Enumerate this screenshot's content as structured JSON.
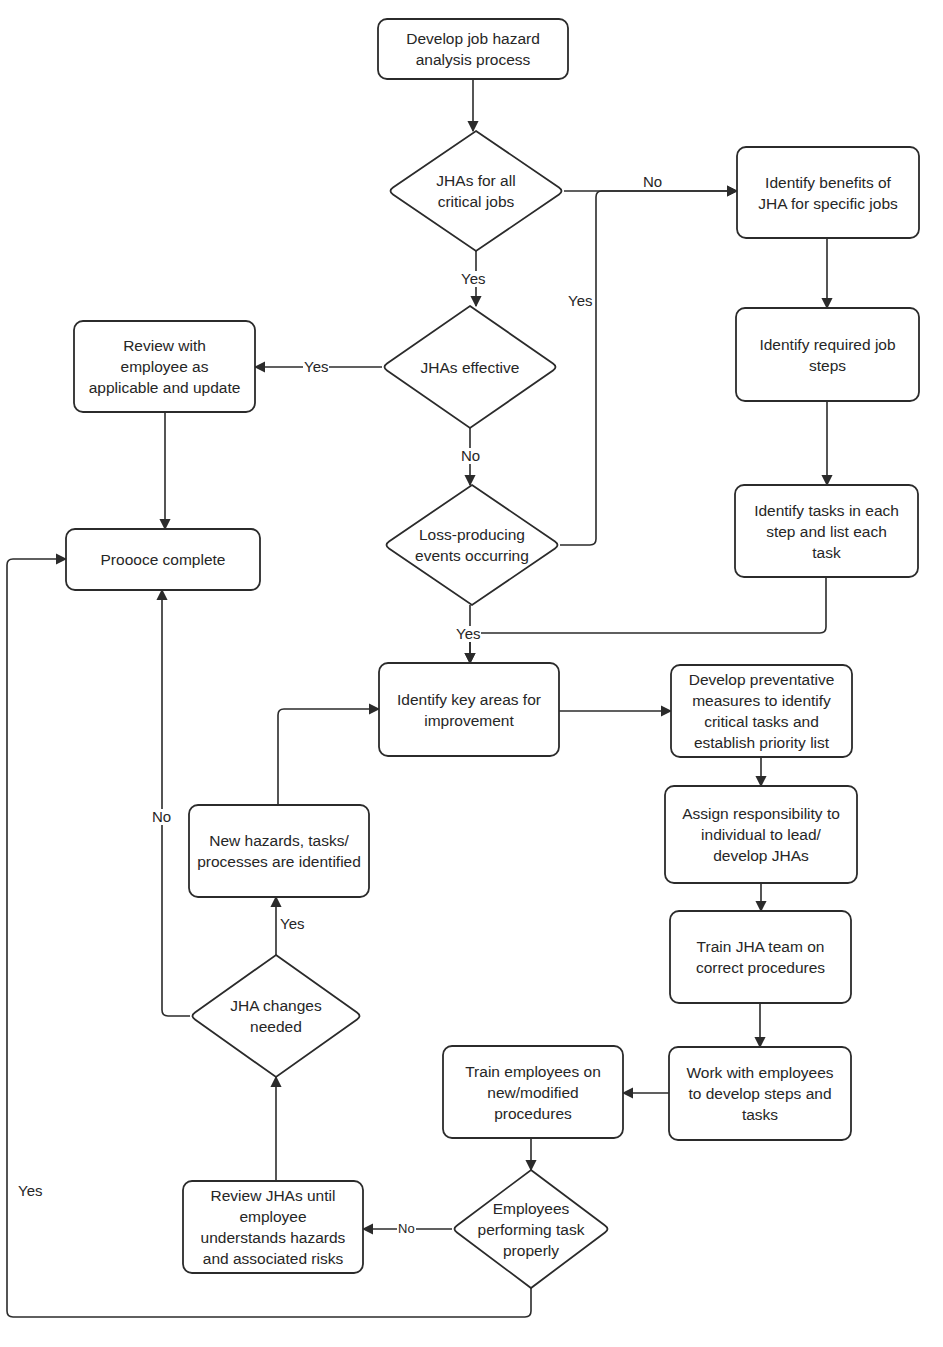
{
  "diagram": {
    "type": "flowchart",
    "colors": {
      "background": "#ffffff",
      "stroke": "#2b2b2b",
      "text": "#262626"
    },
    "nodes": [
      {
        "id": "start",
        "shape": "rounded-rect",
        "text": "Develop job hazard\nanalysis process",
        "x": 378,
        "y": 19,
        "w": 190,
        "h": 60
      },
      {
        "id": "d_critical",
        "shape": "diamond",
        "text": "JHAs for all\ncritical jobs",
        "x": 388,
        "y": 131,
        "w": 176,
        "h": 120
      },
      {
        "id": "benefits",
        "shape": "rounded-rect",
        "text": "Identify benefits of\nJHA for specific jobs",
        "x": 737,
        "y": 147,
        "w": 182,
        "h": 91
      },
      {
        "id": "d_effective",
        "shape": "diamond",
        "text": "JHAs effective",
        "x": 382,
        "y": 306,
        "w": 176,
        "h": 122
      },
      {
        "id": "review_update",
        "shape": "rounded-rect",
        "text": "Review with\nemployee as\napplicable and update",
        "x": 74,
        "y": 321,
        "w": 181,
        "h": 91
      },
      {
        "id": "job_steps",
        "shape": "rounded-rect",
        "text": "Identify required job\nsteps",
        "x": 736,
        "y": 308,
        "w": 183,
        "h": 93
      },
      {
        "id": "d_loss",
        "shape": "diamond",
        "text": "Loss-producing\nevents occurring",
        "x": 384,
        "y": 485,
        "w": 176,
        "h": 120
      },
      {
        "id": "tasks",
        "shape": "rounded-rect",
        "text": "Identify tasks in each\nstep and list each\ntask",
        "x": 735,
        "y": 485,
        "w": 183,
        "h": 92
      },
      {
        "id": "complete",
        "shape": "rounded-rect",
        "text": "Proooce complete",
        "x": 66,
        "y": 529,
        "w": 194,
        "h": 61
      },
      {
        "id": "key_areas",
        "shape": "rounded-rect",
        "text": "Identify key areas for\nimprovement",
        "x": 379,
        "y": 663,
        "w": 180,
        "h": 93
      },
      {
        "id": "preventative",
        "shape": "rounded-rect",
        "text": "Develop preventative\nmeasures to identify\ncritical tasks and\nestablish priority list",
        "x": 671,
        "y": 665,
        "w": 181,
        "h": 92
      },
      {
        "id": "assign",
        "shape": "rounded-rect",
        "text": "Assign responsibility to\nindividual to lead/\ndevelop JHAs",
        "x": 665,
        "y": 786,
        "w": 192,
        "h": 97
      },
      {
        "id": "new_hazards",
        "shape": "rounded-rect",
        "text": "New hazards, tasks/\nprocesses are identified",
        "x": 189,
        "y": 805,
        "w": 180,
        "h": 92
      },
      {
        "id": "train_team",
        "shape": "rounded-rect",
        "text": "Train JHA team on\ncorrect procedures",
        "x": 670,
        "y": 911,
        "w": 181,
        "h": 92
      },
      {
        "id": "d_changes",
        "shape": "diamond",
        "text": "JHA changes\nneeded",
        "x": 190,
        "y": 955,
        "w": 172,
        "h": 122
      },
      {
        "id": "train_employees",
        "shape": "rounded-rect",
        "text": "Train employees on\nnew/modified\nprocedures",
        "x": 443,
        "y": 1046,
        "w": 180,
        "h": 92
      },
      {
        "id": "work_with",
        "shape": "rounded-rect",
        "text": "Work with employees\nto develop steps and\ntasks",
        "x": 669,
        "y": 1047,
        "w": 182,
        "h": 93
      },
      {
        "id": "review_jhas",
        "shape": "rounded-rect",
        "text": "Review JHAs until\nemployee\nunderstands hazards\nand associated risks",
        "x": 183,
        "y": 1181,
        "w": 180,
        "h": 92
      },
      {
        "id": "d_performing",
        "shape": "diamond",
        "text": "Employees\nperforming task\nproperly",
        "x": 452,
        "y": 1170,
        "w": 158,
        "h": 118
      }
    ],
    "edges": [
      {
        "from": "start",
        "to": "d_critical",
        "label": "",
        "points": [
          [
            473,
            79
          ],
          [
            473,
            131
          ]
        ]
      },
      {
        "from": "d_critical",
        "to": "benefits",
        "label": "No",
        "points": [
          [
            564,
            191
          ],
          [
            737,
            191
          ]
        ]
      },
      {
        "from": "d_critical",
        "to": "d_effective",
        "label": "Yes",
        "points": [
          [
            476,
            251
          ],
          [
            476,
            306
          ]
        ]
      },
      {
        "from": "d_loss",
        "to": "benefits",
        "label": "Yes",
        "points": [
          [
            560,
            545
          ],
          [
            596,
            545
          ],
          [
            596,
            191
          ],
          [
            737,
            191
          ]
        ]
      },
      {
        "from": "benefits",
        "to": "job_steps",
        "label": "",
        "points": [
          [
            827,
            238
          ],
          [
            827,
            308
          ]
        ]
      },
      {
        "from": "job_steps",
        "to": "tasks",
        "label": "",
        "points": [
          [
            827,
            401
          ],
          [
            827,
            485
          ]
        ]
      },
      {
        "from": "d_effective",
        "to": "review_update",
        "label": "Yes",
        "points": [
          [
            382,
            367
          ],
          [
            255,
            367
          ]
        ]
      },
      {
        "from": "d_effective",
        "to": "d_loss",
        "label": "No",
        "points": [
          [
            470,
            428
          ],
          [
            470,
            485
          ]
        ]
      },
      {
        "from": "review_update",
        "to": "complete",
        "label": "",
        "points": [
          [
            165,
            412
          ],
          [
            165,
            529
          ]
        ]
      },
      {
        "from": "tasks",
        "to": "key_areas",
        "label": "",
        "points": [
          [
            826,
            577
          ],
          [
            826,
            633
          ],
          [
            470,
            633
          ],
          [
            470,
            663
          ]
        ]
      },
      {
        "from": "d_loss",
        "to": "key_areas",
        "label": "Yes",
        "points": [
          [
            470,
            605
          ],
          [
            470,
            663
          ]
        ]
      },
      {
        "from": "key_areas",
        "to": "preventative",
        "label": "",
        "points": [
          [
            559,
            711
          ],
          [
            671,
            711
          ]
        ]
      },
      {
        "from": "preventative",
        "to": "assign",
        "label": "",
        "points": [
          [
            761,
            757
          ],
          [
            761,
            786
          ]
        ]
      },
      {
        "from": "assign",
        "to": "train_team",
        "label": "",
        "points": [
          [
            761,
            883
          ],
          [
            761,
            911
          ]
        ]
      },
      {
        "from": "train_team",
        "to": "work_with",
        "label": "",
        "points": [
          [
            760,
            1003
          ],
          [
            760,
            1047
          ]
        ]
      },
      {
        "from": "work_with",
        "to": "train_employees",
        "label": "",
        "points": [
          [
            669,
            1093
          ],
          [
            623,
            1093
          ]
        ]
      },
      {
        "from": "train_employees",
        "to": "d_performing",
        "label": "",
        "points": [
          [
            531,
            1138
          ],
          [
            531,
            1170
          ]
        ]
      },
      {
        "from": "d_performing",
        "to": "review_jhas",
        "label": "No",
        "points": [
          [
            452,
            1229
          ],
          [
            363,
            1229
          ]
        ]
      },
      {
        "from": "d_performing",
        "to": "complete",
        "label": "Yes",
        "points": [
          [
            531,
            1288
          ],
          [
            531,
            1317
          ],
          [
            7,
            1317
          ],
          [
            7,
            559
          ],
          [
            66,
            559
          ]
        ]
      },
      {
        "from": "review_jhas",
        "to": "d_changes",
        "label": "",
        "points": [
          [
            276,
            1181
          ],
          [
            276,
            1077
          ]
        ]
      },
      {
        "from": "d_changes",
        "to": "new_hazards",
        "label": "Yes",
        "points": [
          [
            276,
            955
          ],
          [
            276,
            897
          ]
        ]
      },
      {
        "from": "d_changes",
        "to": "complete",
        "label": "No",
        "points": [
          [
            190,
            1016
          ],
          [
            162,
            1016
          ],
          [
            162,
            590
          ]
        ]
      },
      {
        "from": "new_hazards",
        "to": "key_areas",
        "label": "",
        "points": [
          [
            278,
            805
          ],
          [
            278,
            709
          ],
          [
            379,
            709
          ]
        ]
      }
    ],
    "edge_labels": [
      {
        "text": "No",
        "x": 642,
        "y": 174,
        "size": "normal"
      },
      {
        "text": "Yes",
        "x": 460,
        "y": 271,
        "size": "normal"
      },
      {
        "text": "Yes",
        "x": 567,
        "y": 293,
        "size": "normal"
      },
      {
        "text": "Yes",
        "x": 303,
        "y": 359,
        "size": "normal"
      },
      {
        "text": "No",
        "x": 460,
        "y": 448,
        "size": "normal"
      },
      {
        "text": "Yes",
        "x": 455,
        "y": 626,
        "size": "normal"
      },
      {
        "text": "No",
        "x": 151,
        "y": 809,
        "size": "normal"
      },
      {
        "text": "Yes",
        "x": 279,
        "y": 916,
        "size": "normal"
      },
      {
        "text": "Yes",
        "x": 17,
        "y": 1183,
        "size": "normal"
      },
      {
        "text": "No",
        "x": 397,
        "y": 1221,
        "size": "small"
      }
    ]
  }
}
